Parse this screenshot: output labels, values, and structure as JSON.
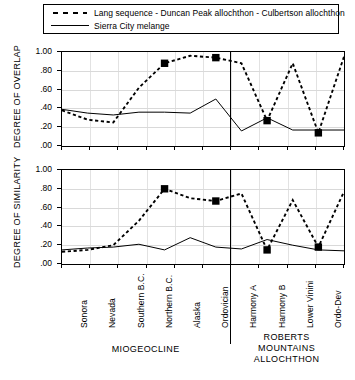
{
  "legend": {
    "entries": [
      {
        "label": "Lang sequence - Duncan Peak allochthon - Culbertson allochthon",
        "style": "dashed-with-square-markers",
        "icon": "dashed-line-icon"
      },
      {
        "label": "Sierra City melange",
        "style": "solid",
        "icon": "solid-line-icon"
      }
    ]
  },
  "axis": {
    "ytitle_top": "DEGREE OF OVERLAP",
    "ytitle_bottom": "DEGREE OF SIMILARITY",
    "yticklabels": [
      "1.00",
      ".80",
      ".60",
      ".40",
      ".20",
      ".00"
    ]
  },
  "groups": [
    {
      "label": "MIOGEOCLINE",
      "lines": [
        "MIOGEOCLINE"
      ]
    },
    {
      "label": "ROBERTS MOUNTAINS ALLOCHTHON",
      "lines": [
        "ROBERTS",
        "MOUNTAINS",
        "ALLOCHTHON"
      ]
    }
  ],
  "chart_data": [
    {
      "type": "line",
      "title": "DEGREE OF OVERLAP",
      "xlabel": "",
      "ylabel": "DEGREE OF OVERLAP",
      "ylim": [
        0.0,
        1.0
      ],
      "yticks": [
        0.0,
        0.2,
        0.4,
        0.6,
        0.8,
        1.0
      ],
      "yticklabels": [
        ".00",
        ".20",
        ".40",
        ".60",
        ".80",
        "1.00"
      ],
      "grid": true,
      "legend_position": "above-plot",
      "categories": [
        "Sonora",
        "Nevada",
        "Southern B.C.",
        "Northern B.C.",
        "Alaska",
        "Ordovician",
        "Harmony A",
        "Harmony B",
        "Lower Vinini",
        "Ordo-Dev"
      ],
      "series": [
        {
          "name": "Lang sequence - Duncan Peak allochthon - Culbertson allochthon",
          "style": "dashed",
          "marker": "filled-square",
          "marker_at": [
            "Northern B.C.",
            "Ordovician",
            "Harmony B",
            "Ordo-Dev"
          ],
          "values": [
            0.38,
            0.28,
            0.25,
            0.62,
            0.88,
            0.96,
            0.94,
            0.88,
            0.27,
            0.88,
            0.14,
            0.95
          ]
        },
        {
          "name": "Sierra City melange",
          "style": "solid",
          "marker": "none",
          "values": [
            0.39,
            0.35,
            0.33,
            0.36,
            0.36,
            0.35,
            0.5,
            0.16,
            0.3,
            0.17,
            0.17,
            0.17
          ]
        }
      ]
    },
    {
      "type": "line",
      "title": "DEGREE OF SIMILARITY",
      "xlabel": "",
      "ylabel": "DEGREE OF SIMILARITY",
      "ylim": [
        0.0,
        1.0
      ],
      "yticks": [
        0.0,
        0.2,
        0.4,
        0.6,
        0.8,
        1.0
      ],
      "yticklabels": [
        ".00",
        ".20",
        ".40",
        ".60",
        ".80",
        "1.00"
      ],
      "grid": true,
      "legend_position": "above-plot",
      "categories": [
        "Sonora",
        "Nevada",
        "Southern B.C.",
        "Northern B.C.",
        "Alaska",
        "Ordovician",
        "Harmony A",
        "Harmony B",
        "Lower Vinini",
        "Ordo-Dev"
      ],
      "series": [
        {
          "name": "Lang sequence - Duncan Peak allochthon - Culbertson allochthon",
          "style": "dashed",
          "marker": "filled-square",
          "marker_at": [
            "Northern B.C.",
            "Ordovician",
            "Harmony B",
            "Ordo-Dev"
          ],
          "values": [
            0.13,
            0.15,
            0.2,
            0.46,
            0.8,
            0.7,
            0.67,
            0.75,
            0.15,
            0.68,
            0.18,
            0.77
          ]
        },
        {
          "name": "Sierra City melange",
          "style": "solid",
          "marker": "none",
          "values": [
            0.15,
            0.17,
            0.18,
            0.21,
            0.15,
            0.28,
            0.18,
            0.16,
            0.26,
            0.2,
            0.15,
            0.14
          ]
        }
      ]
    }
  ]
}
